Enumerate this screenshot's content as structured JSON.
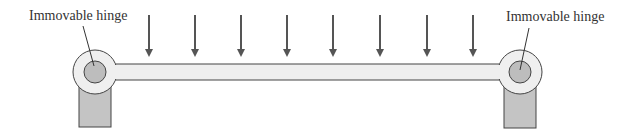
{
  "diagram": {
    "type": "simply supported beam with distributed load",
    "labels": {
      "left_hinge": "Immovable hinge",
      "right_hinge": "Immovable hinge"
    },
    "load_arrows": {
      "count": 8,
      "x_positions": [
        149,
        195,
        241,
        287,
        333,
        380,
        427,
        473
      ]
    },
    "colors": {
      "arrow": "#555555",
      "beam_fill": "#efefef",
      "outline": "#444444",
      "hinge_pin": "#bdbdbd",
      "support": "#c4c4c4",
      "text": "#333333"
    }
  }
}
